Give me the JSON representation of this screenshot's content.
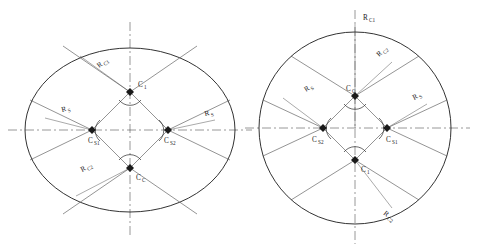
{
  "figure": {
    "title": "",
    "background": "#ffffff",
    "stroke_color": "#1c1c1c",
    "width": 479,
    "height": 252
  },
  "left_diagram": {
    "name": "elliptical-layout",
    "shape": "ellipse",
    "center": {
      "x": 130,
      "y": 130
    },
    "radius_x": 105,
    "radius_y": 82,
    "nodes": [
      {
        "id": "C1",
        "label": "C",
        "sub": "1",
        "x": 130,
        "y": 92
      },
      {
        "id": "CS1",
        "label": "C",
        "sub": "S1",
        "x": 92,
        "y": 130
      },
      {
        "id": "CS2",
        "label": "C",
        "sub": "S2",
        "x": 168,
        "y": 130
      },
      {
        "id": "CC",
        "label": "C",
        "sub": "C",
        "x": 130,
        "y": 168
      }
    ],
    "dimension_labels": [
      {
        "id": "R_C1_left",
        "label": "R",
        "sub": "C1",
        "x": 99,
        "y": 68
      },
      {
        "id": "R_S_left",
        "label": "R",
        "sub": "S",
        "x": 62,
        "y": 112
      },
      {
        "id": "R_S_right",
        "label": "R",
        "sub": "S",
        "x": 205,
        "y": 116
      },
      {
        "id": "R_C2_left",
        "label": "R",
        "sub": "C2",
        "x": 82,
        "y": 172
      }
    ]
  },
  "right_diagram": {
    "name": "circular-layout",
    "shape": "circle",
    "center": {
      "x": 355,
      "y": 128
    },
    "radius": 96,
    "nodes": [
      {
        "id": "CC",
        "label": "C",
        "sub": "C",
        "x": 355,
        "y": 96
      },
      {
        "id": "CS2",
        "label": "C",
        "sub": "S2",
        "x": 323,
        "y": 128
      },
      {
        "id": "CS1",
        "label": "C",
        "sub": "S1",
        "x": 387,
        "y": 128
      },
      {
        "id": "C1",
        "label": "C",
        "sub": "1",
        "x": 355,
        "y": 160
      }
    ],
    "dimension_labels": [
      {
        "id": "R_C1_top",
        "label": "R",
        "sub": "C1",
        "x": 363,
        "y": 20
      },
      {
        "id": "R_C2_upper",
        "label": "R",
        "sub": "C2",
        "x": 379,
        "y": 57
      },
      {
        "id": "R_S_left",
        "label": "R",
        "sub": "S",
        "x": 306,
        "y": 92
      },
      {
        "id": "R_S_right",
        "label": "R",
        "sub": "S",
        "x": 414,
        "y": 100
      },
      {
        "id": "R_C2_lower",
        "label": "R",
        "sub": "C2",
        "x": 383,
        "y": 214
      }
    ]
  }
}
